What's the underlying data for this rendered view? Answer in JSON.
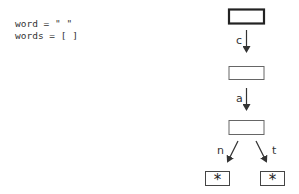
{
  "code": {
    "line1": "word = \" \"",
    "line2": "words = [ ]"
  },
  "trie": {
    "edges": [
      {
        "label": "c",
        "from": "root",
        "to": "node_c"
      },
      {
        "label": "a",
        "from": "node_c",
        "to": "node_a"
      },
      {
        "label": "n",
        "from": "node_a",
        "to": "leaf_n"
      },
      {
        "label": "t",
        "from": "node_a",
        "to": "leaf_t"
      }
    ],
    "leaf_marker": "*",
    "colors": {
      "stroke": "#333333",
      "current_node_stroke": "#222222"
    }
  }
}
